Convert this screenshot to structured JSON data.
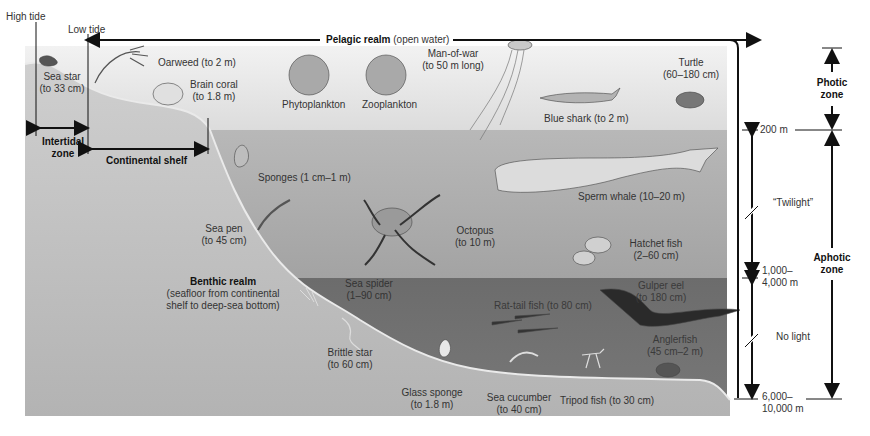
{
  "diagram": {
    "colors": {
      "photic_water": "#e4e4e4",
      "twilight_water": "#aeaeae",
      "dark_water": "#6f6f6f",
      "seafloor": "#bdbdbd",
      "line": "#111111"
    },
    "top_labels": {
      "high_tide": "High tide",
      "low_tide": "Low tide",
      "pelagic_bold": "Pelagic realm",
      "pelagic_rest": "(open water)"
    },
    "shore_labels": {
      "intertidal_line1": "Intertidal",
      "intertidal_line2": "zone",
      "continental_shelf": "Continental shelf"
    },
    "benthic": {
      "title": "Benthic realm",
      "line1": "(seafloor from continental",
      "line2": "shelf to deep-sea bottom)"
    },
    "organisms": [
      {
        "name": "Sea star",
        "size": "(to 33 cm)"
      },
      {
        "name": "Oarweed (to 2 m)"
      },
      {
        "name": "Brain coral",
        "size": "(to 1.8 m)"
      },
      {
        "name": "Phytoplankton"
      },
      {
        "name": "Zooplankton"
      },
      {
        "name": "Man-of-war",
        "size": "(to 50 m long)"
      },
      {
        "name": "Blue shark (to 2 m)"
      },
      {
        "name": "Turtle",
        "size": "(60–180 cm)"
      },
      {
        "name": "Sponges (1 cm–1 m)"
      },
      {
        "name": "Sea pen",
        "size": "(to 45 cm)"
      },
      {
        "name": "Octopus",
        "size": "(to 10 m)"
      },
      {
        "name": "Sperm whale (10–20 m)"
      },
      {
        "name": "Hatchet fish",
        "size": "(2–60 cm)"
      },
      {
        "name": "Sea spider",
        "size": "(1–90 cm)"
      },
      {
        "name": "Rat-tail fish (to 80 cm)"
      },
      {
        "name": "Gulper eel",
        "size": "(to 180 cm)"
      },
      {
        "name": "Anglerfish",
        "size": "(45 cm–2 m)"
      },
      {
        "name": "Brittle star",
        "size": "(to 60 cm)"
      },
      {
        "name": "Glass sponge",
        "size": "(to 1.8 m)"
      },
      {
        "name": "Sea cucumber",
        "size": "(to 40 cm)"
      },
      {
        "name": "Tripod fish (to 30 cm)"
      }
    ],
    "depth_scale": {
      "depth_200": "200 m",
      "depth_1000_l1": "1,000–",
      "depth_1000_l2": "4,000 m",
      "depth_6000_l1": "6,000–",
      "depth_6000_l2": "10,000 m",
      "twilight": "“Twilight”",
      "no_light": "No light"
    },
    "zones": {
      "photic_l1": "Photic",
      "photic_l2": "zone",
      "aphotic_l1": "Aphotic",
      "aphotic_l2": "zone"
    }
  }
}
